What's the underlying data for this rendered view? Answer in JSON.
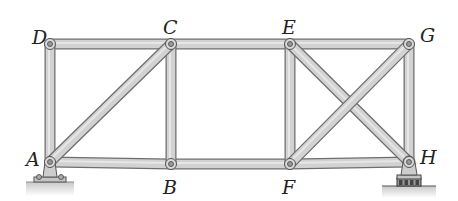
{
  "diagram": {
    "type": "truss",
    "colors": {
      "member_fill": "#d2d2d2",
      "member_stroke": "#6e6e6e",
      "pin_fill": "#bdbdbd",
      "ground": "#cfcfcf",
      "label": "#222222"
    },
    "joints": {
      "A": {
        "x": 50,
        "y": 162,
        "label": "A",
        "label_x": 26,
        "label_y": 150
      },
      "B": {
        "x": 171,
        "y": 164,
        "label": "B",
        "label_x": 163,
        "label_y": 178
      },
      "C": {
        "x": 171,
        "y": 44,
        "label": "C",
        "label_x": 163,
        "label_y": 18
      },
      "D": {
        "x": 50,
        "y": 44,
        "label": "D",
        "label_x": 32,
        "label_y": 28
      },
      "E": {
        "x": 290,
        "y": 44,
        "label": "E",
        "label_x": 282,
        "label_y": 18
      },
      "F": {
        "x": 290,
        "y": 164,
        "label": "F",
        "label_x": 282,
        "label_y": 178
      },
      "G": {
        "x": 409,
        "y": 44,
        "label": "G",
        "label_x": 420,
        "label_y": 26
      },
      "H": {
        "x": 409,
        "y": 162,
        "label": "H",
        "label_x": 420,
        "label_y": 148
      }
    },
    "members": [
      [
        "D",
        "C"
      ],
      [
        "C",
        "E"
      ],
      [
        "E",
        "G"
      ],
      [
        "A",
        "B"
      ],
      [
        "B",
        "F"
      ],
      [
        "F",
        "H"
      ],
      [
        "A",
        "D"
      ],
      [
        "B",
        "C"
      ],
      [
        "F",
        "E"
      ],
      [
        "H",
        "G"
      ],
      [
        "A",
        "C"
      ],
      [
        "E",
        "H"
      ],
      [
        "F",
        "G"
      ]
    ],
    "supports": [
      {
        "joint": "A",
        "type": "pin"
      },
      {
        "joint": "H",
        "type": "roller"
      }
    ]
  }
}
